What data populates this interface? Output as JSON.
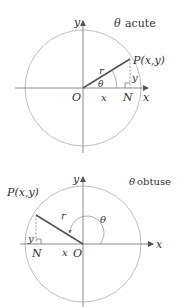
{
  "diagrams": [
    {
      "caption_symbol": "θ",
      "caption_text": "acute",
      "labels": {
        "y_axis": "y",
        "x_axis": "x",
        "origin": "O",
        "point": "P(x,y)",
        "radius": "r",
        "angle": "θ",
        "adjacent": "x",
        "opposite": "y",
        "foot": "N"
      }
    },
    {
      "caption_symbol": "θ",
      "caption_text": "obtuse",
      "labels": {
        "y_axis": "y",
        "x_axis": "x",
        "origin": "O",
        "point": "P(x,y)",
        "radius": "r",
        "angle": "θ",
        "adjacent": "x",
        "opposite": "y",
        "foot": "N"
      }
    }
  ],
  "colors": {
    "circle": "#bdbdbd",
    "axis": "#8a8a8a",
    "radius": "#555555",
    "text": "#333333"
  }
}
